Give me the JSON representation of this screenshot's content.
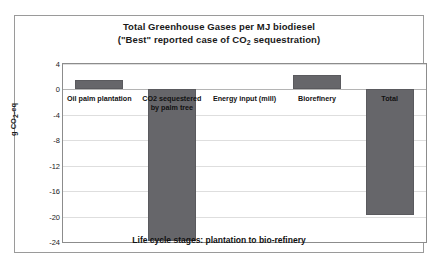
{
  "chart_data": {
    "type": "bar",
    "title": "Total Greenhouse Gases per MJ biodiesel",
    "subtitle": "(\"Best\" reported case of CO2 sequestration)",
    "subtitle_prefix": "(\"Best\" reported case of CO",
    "subtitle_sub": "2",
    "subtitle_suffix": " sequestration)",
    "xlabel": "Life cycle stages: plantation to bio-refinery",
    "ylabel_prefix": "g CO",
    "ylabel_sub": "2",
    "ylabel_suffix": "-eq",
    "ylabel": "g CO2-eq",
    "categories": [
      "Oil palm plantation",
      "CO2 sequestered by palm tree",
      "Energy input (mill)",
      "Biorefinery",
      "Total"
    ],
    "category_lines": [
      [
        "Oil palm plantation"
      ],
      [
        "CO2 sequestered",
        "by palm tree"
      ],
      [
        "Energy input (mill)"
      ],
      [
        "Biorefinery"
      ],
      [
        "Total"
      ]
    ],
    "values": [
      1.5,
      -23.9,
      0.0,
      2.2,
      -19.7
    ],
    "ylim": [
      -24,
      4
    ],
    "yticks": [
      4,
      0,
      -4,
      -8,
      -12,
      -16,
      -20,
      -24
    ],
    "ytick_labels": [
      "4",
      "0",
      "-4",
      "-8",
      "-12",
      "-16",
      "-20",
      "-24"
    ],
    "grid": true,
    "legend": "none",
    "bar_color": "#66666a",
    "frame_color": "#9a9a9a",
    "gridline_color": "#dedede"
  }
}
